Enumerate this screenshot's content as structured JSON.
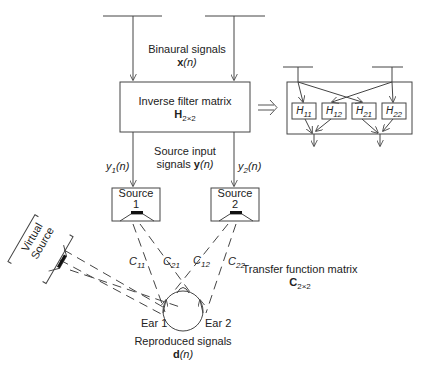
{
  "diagram": {
    "binaural": {
      "line1": "Binaural signals",
      "sym": "x",
      "arg": "(n)"
    },
    "inverse_filter": {
      "line1": "Inverse filter matrix",
      "sym": "H",
      "sub": "2×2"
    },
    "source_input": {
      "line1": "Source input",
      "line2a": "signals ",
      "sym": "y",
      "arg": "(n)"
    },
    "y1": {
      "sym": "y",
      "sub": "1",
      "arg": "(n)"
    },
    "y2": {
      "sym": "y",
      "sub": "2",
      "arg": "(n)"
    },
    "source1": {
      "line1": "Source",
      "line2": "1"
    },
    "source2": {
      "line1": "Source",
      "line2": "2"
    },
    "virtual_source": {
      "line1": "Virtual",
      "line2": "Source"
    },
    "paths": [
      {
        "sym": "C",
        "sub": "11"
      },
      {
        "sym": "C",
        "sub": "21"
      },
      {
        "sym": "C",
        "sub": "12"
      },
      {
        "sym": "C",
        "sub": "22"
      }
    ],
    "transfer": {
      "line1": "Transfer function matrix",
      "sym": "C",
      "sub": "2×2"
    },
    "ear1": "Ear 1",
    "ear2": "Ear 2",
    "reproduced": {
      "line1": "Reproduced signals",
      "sym": "d",
      "arg": "(n)"
    },
    "filters": [
      {
        "sym": "H",
        "sub": "11"
      },
      {
        "sym": "H",
        "sub": "12"
      },
      {
        "sym": "H",
        "sub": "21"
      },
      {
        "sym": "H",
        "sub": "22"
      }
    ],
    "arrow_symbol": "⟹"
  }
}
